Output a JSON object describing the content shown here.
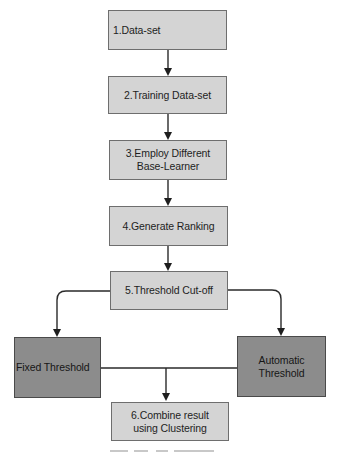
{
  "diagram": {
    "type": "flowchart",
    "colors": {
      "light_fill": "#d4d4d4",
      "dark_fill": "#8c8c8c",
      "border": "#6e6e6e",
      "line": "#2a2a2a",
      "text": "#1e1e1e"
    },
    "nodes": [
      {
        "id": "n1",
        "line1": "1.Data-set",
        "line2": ""
      },
      {
        "id": "n2",
        "line1": "2.Training Data-set",
        "line2": ""
      },
      {
        "id": "n3",
        "line1": "3.Employ Different",
        "line2": "Base-Learner"
      },
      {
        "id": "n4",
        "line1": "4.Generate Ranking",
        "line2": ""
      },
      {
        "id": "n5",
        "line1": "5.Threshold Cut-off",
        "line2": ""
      },
      {
        "id": "fixed",
        "line1": "Fixed Threshold",
        "line2": ""
      },
      {
        "id": "auto",
        "line1": "Automatic",
        "line2": "Threshold"
      },
      {
        "id": "n6",
        "line1": "6.Combine result",
        "line2": "using Clustering"
      }
    ],
    "edges": [
      {
        "from": "n1",
        "to": "n2"
      },
      {
        "from": "n2",
        "to": "n3"
      },
      {
        "from": "n3",
        "to": "n4"
      },
      {
        "from": "n4",
        "to": "n5"
      },
      {
        "from": "n5",
        "to": "fixed"
      },
      {
        "from": "n5",
        "to": "auto"
      },
      {
        "from": "fixed",
        "to": "n6"
      },
      {
        "from": "auto",
        "to": "n6"
      }
    ]
  }
}
